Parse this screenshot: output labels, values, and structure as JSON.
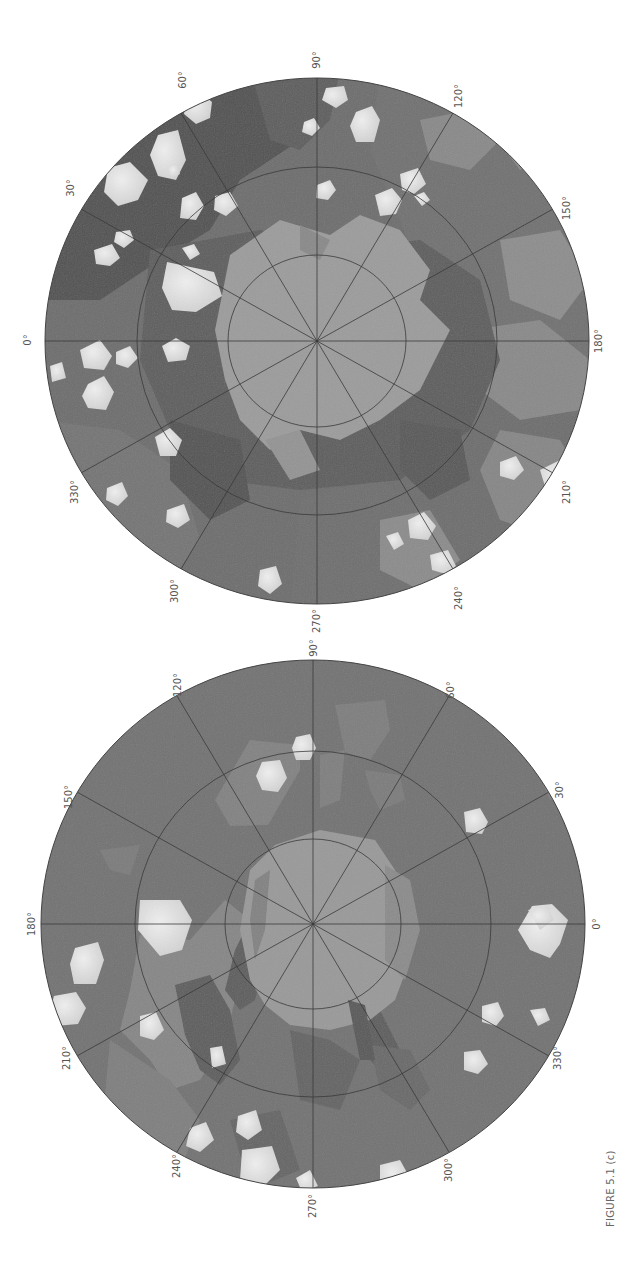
{
  "figure": {
    "caption": "FIGURE 5.1 (c)",
    "orientation": "rotated 90° counter-clockwise",
    "colors": {
      "background": "#ffffff",
      "unit_dark": "#5a5a5a",
      "unit_medium": "#747474",
      "unit_light": "#8e8e8e",
      "polar_cap": "#9c9c9c",
      "crater_bright": "#dedede",
      "grid": "#3a3a3a",
      "label": "#555555"
    }
  },
  "maps": [
    {
      "id": "upper-hemisphere-map",
      "graticule_rings": 2,
      "meridian_spacing_deg": 30,
      "longitude_labels": [
        {
          "text": "0°",
          "x": 31,
          "y": 340
        },
        {
          "text": "30°",
          "x": 74,
          "y": 188
        },
        {
          "text": "60°",
          "x": 186,
          "y": 80
        },
        {
          "text": "90°",
          "x": 317,
          "y": 48
        },
        {
          "text": "120°",
          "x": 458,
          "y": 86
        },
        {
          "text": "150°",
          "x": 566,
          "y": 200
        },
        {
          "text": "180°",
          "x": 599,
          "y": 341
        },
        {
          "text": "210°",
          "x": 566,
          "y": 490
        },
        {
          "text": "240°",
          "x": 460,
          "y": 598
        },
        {
          "text": "270°",
          "x": 317,
          "y": 621
        },
        {
          "text": "300°",
          "x": 176,
          "y": 591
        },
        {
          "text": "330°",
          "x": 75,
          "y": 492
        }
      ]
    },
    {
      "id": "lower-hemisphere-map",
      "graticule_rings": 2,
      "meridian_spacing_deg": 30,
      "longitude_labels": [
        {
          "text": "90°",
          "x": 314,
          "y": 648
        },
        {
          "text": "120°",
          "x": 178,
          "y": 685
        },
        {
          "text": "150°",
          "x": 69,
          "y": 797
        },
        {
          "text": "180°",
          "x": 32,
          "y": 924
        },
        {
          "text": "210°",
          "x": 67,
          "y": 1058
        },
        {
          "text": "240°",
          "x": 177,
          "y": 1166
        },
        {
          "text": "270°",
          "x": 313,
          "y": 1205
        },
        {
          "text": "300°",
          "x": 450,
          "y": 1168
        },
        {
          "text": "330°",
          "x": 558,
          "y": 1058
        },
        {
          "text": "0°",
          "x": 597,
          "y": 924
        },
        {
          "text": "30°",
          "x": 560,
          "y": 790
        },
        {
          "text": "60°",
          "x": 451,
          "y": 690
        }
      ]
    }
  ]
}
